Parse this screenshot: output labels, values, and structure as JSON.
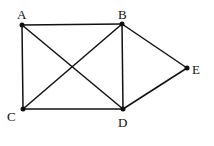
{
  "diagram": {
    "type": "graph",
    "nodes": [
      {
        "id": "A",
        "label": "A",
        "x": 22,
        "y": 25,
        "lx": 17,
        "ly": 19
      },
      {
        "id": "B",
        "label": "B",
        "x": 122,
        "y": 24,
        "lx": 118,
        "ly": 19
      },
      {
        "id": "E",
        "label": "E",
        "x": 187,
        "y": 68,
        "lx": 192,
        "ly": 74
      },
      {
        "id": "C",
        "label": "C",
        "x": 23,
        "y": 109,
        "lx": 7,
        "ly": 121
      },
      {
        "id": "D",
        "label": "D",
        "x": 123,
        "y": 109,
        "lx": 118,
        "ly": 127
      }
    ],
    "edges": [
      [
        "A",
        "B"
      ],
      [
        "A",
        "C"
      ],
      [
        "A",
        "D"
      ],
      [
        "B",
        "C"
      ],
      [
        "B",
        "D"
      ],
      [
        "B",
        "E"
      ],
      [
        "C",
        "D"
      ],
      [
        "D",
        "E"
      ]
    ]
  }
}
